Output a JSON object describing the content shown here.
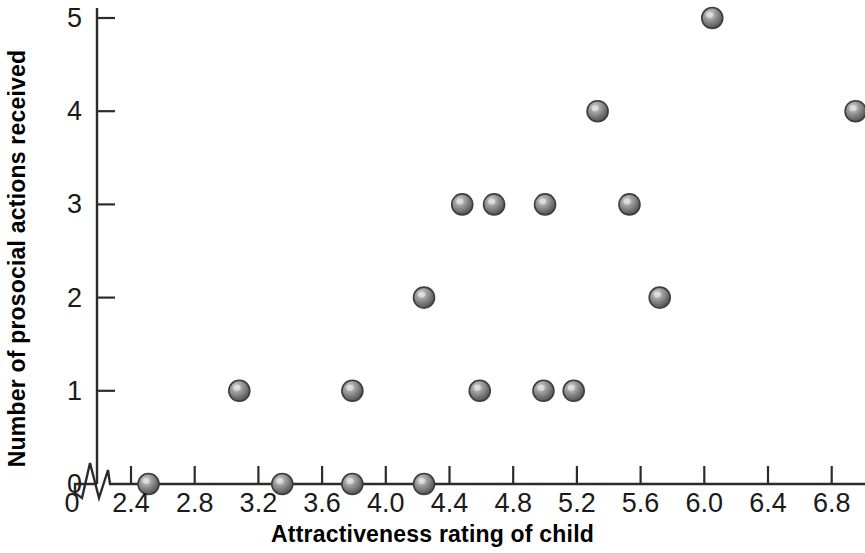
{
  "chart_data": {
    "type": "scatter",
    "title": "",
    "xlabel": "Attractiveness rating of child",
    "ylabel": "Number of prosocial actions received",
    "xlim": [
      2.2,
      7.0
    ],
    "ylim": [
      0,
      5
    ],
    "x_axis_break": true,
    "x_origin_label": "0",
    "grid": false,
    "legend": null,
    "marker_style": "sphere",
    "marker_color": "#808080",
    "marker_edge_color": "#3d3d3d",
    "xticks": [
      2.4,
      2.8,
      3.2,
      3.6,
      4.0,
      4.4,
      4.8,
      5.2,
      5.6,
      6.0,
      6.4,
      6.8
    ],
    "xtick_labels": [
      "2.4",
      "2.8",
      "3.2",
      "3.6",
      "4.0",
      "4.4",
      "4.8",
      "5.2",
      "5.6",
      "6.0",
      "6.4",
      "6.8"
    ],
    "yticks": [
      0,
      1,
      2,
      3,
      4,
      5
    ],
    "ytick_labels": [
      "0",
      "1",
      "2",
      "3",
      "4",
      "5"
    ],
    "points": [
      {
        "x": 2.51,
        "y": 0
      },
      {
        "x": 3.35,
        "y": 0
      },
      {
        "x": 3.79,
        "y": 0
      },
      {
        "x": 4.24,
        "y": 0
      },
      {
        "x": 3.08,
        "y": 1
      },
      {
        "x": 3.79,
        "y": 1
      },
      {
        "x": 4.59,
        "y": 1
      },
      {
        "x": 4.99,
        "y": 1
      },
      {
        "x": 5.18,
        "y": 1
      },
      {
        "x": 4.24,
        "y": 2
      },
      {
        "x": 5.72,
        "y": 2
      },
      {
        "x": 4.48,
        "y": 3
      },
      {
        "x": 4.68,
        "y": 3
      },
      {
        "x": 5.0,
        "y": 3
      },
      {
        "x": 5.53,
        "y": 3
      },
      {
        "x": 5.33,
        "y": 4
      },
      {
        "x": 6.95,
        "y": 4
      },
      {
        "x": 6.05,
        "y": 5
      }
    ],
    "colors": {
      "axis": "#2b2b2b",
      "text": "#1a1a1a",
      "title": "#000000",
      "background": "#ffffff"
    }
  }
}
